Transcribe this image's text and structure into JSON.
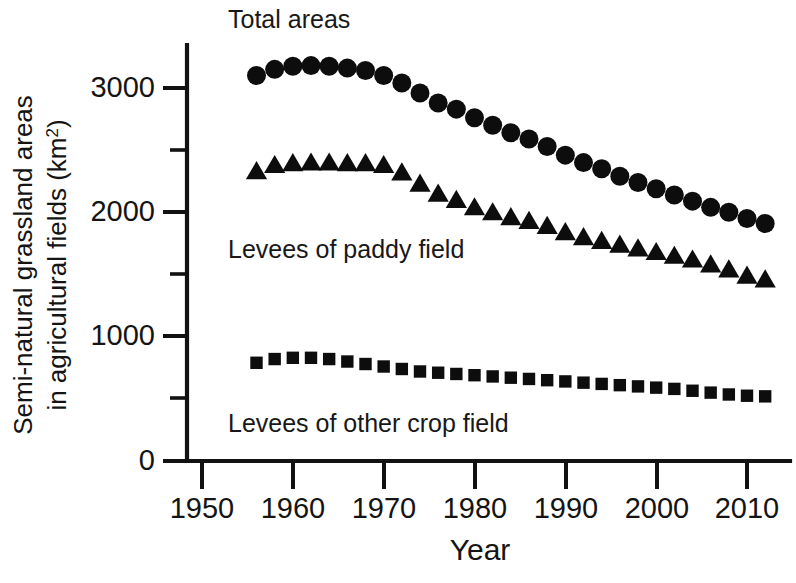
{
  "figure": {
    "background": "#ffffff",
    "ink_color": "#0d0d0d"
  },
  "axes": {
    "x_title": "Year",
    "y_title_line1": "Semi-natural grassland areas",
    "y_title_line2_pre": "in agricultural fields (km",
    "y_title_line2_sup": "2",
    "y_title_line2_post": ")",
    "x_ticks": [
      "1950",
      "1960",
      "1970",
      "1980",
      "1990",
      "2000",
      "2010"
    ],
    "y_ticks": [
      "0",
      "1000",
      "2000",
      "3000"
    ]
  },
  "series_labels": {
    "total": "Total areas",
    "paddy": "Levees of paddy field",
    "other": "Levees of other crop field"
  },
  "chart_data": {
    "type": "scatter",
    "title": "",
    "xlabel": "Year",
    "ylabel": "Semi-natural grassland areas in agricultural fields (km2)",
    "xlim": [
      1948,
      2015
    ],
    "ylim": [
      0,
      3400
    ],
    "xticks": [
      1950,
      1960,
      1970,
      1980,
      1990,
      2000,
      2010
    ],
    "yticks": [
      0,
      1000,
      2000,
      3000
    ],
    "yticks_minor": [
      500,
      1500,
      2500
    ],
    "grid": false,
    "legend": "inline annotations",
    "x": [
      1956,
      1958,
      1960,
      1962,
      1964,
      1966,
      1968,
      1970,
      1972,
      1974,
      1976,
      1978,
      1980,
      1982,
      1984,
      1986,
      1988,
      1990,
      1992,
      1994,
      1996,
      1998,
      2000,
      2002,
      2004,
      2006,
      2008,
      2010,
      2012
    ],
    "series": [
      {
        "name": "Total areas",
        "marker": "circle",
        "values": [
          3100,
          3150,
          3175,
          3180,
          3175,
          3160,
          3140,
          3100,
          3040,
          2960,
          2880,
          2830,
          2760,
          2700,
          2640,
          2590,
          2530,
          2460,
          2400,
          2350,
          2290,
          2240,
          2190,
          2140,
          2090,
          2040,
          2000,
          1950,
          1910
        ]
      },
      {
        "name": "Levees of paddy field",
        "marker": "triangle",
        "values": [
          2330,
          2380,
          2395,
          2400,
          2400,
          2395,
          2395,
          2380,
          2320,
          2230,
          2150,
          2100,
          2040,
          2000,
          1960,
          1930,
          1890,
          1840,
          1800,
          1770,
          1740,
          1710,
          1680,
          1650,
          1620,
          1580,
          1540,
          1490,
          1460
        ]
      },
      {
        "name": "Levees of other crop field",
        "marker": "square",
        "values": [
          790,
          820,
          830,
          830,
          820,
          800,
          780,
          760,
          740,
          720,
          710,
          700,
          690,
          680,
          670,
          660,
          650,
          640,
          630,
          620,
          610,
          600,
          590,
          580,
          565,
          550,
          535,
          525,
          520
        ]
      }
    ]
  },
  "annotations": [
    {
      "name": "total-areas-label",
      "text": "Total areas",
      "x_px": 228,
      "y_px": 22
    },
    {
      "name": "paddy-label",
      "text": "Levees of paddy field",
      "x_px": 228,
      "y_px": 250
    },
    {
      "name": "other-label",
      "text": "Levees of other crop field",
      "x_px": 228,
      "y_px": 424
    }
  ]
}
